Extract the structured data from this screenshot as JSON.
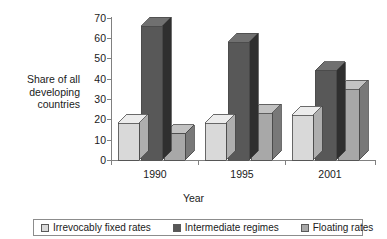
{
  "chart_data": {
    "type": "bar",
    "title": "",
    "subtitle": "",
    "xlabel": "Year",
    "ylabel": "Share of all\ndeveloping\ncountries",
    "categories": [
      "1990",
      "1995",
      "2001"
    ],
    "series": [
      {
        "name": "Irrevocably fixed rates",
        "values": [
          18,
          18,
          22
        ],
        "color": "#d9d9d9"
      },
      {
        "name": "Intermediate regimes",
        "values": [
          66,
          58,
          44
        ],
        "color": "#585858"
      },
      {
        "name": "Floating rates",
        "values": [
          13,
          23,
          35
        ],
        "color": "#a8a8a8"
      }
    ],
    "ylim": [
      0,
      70
    ],
    "ytick_values": [
      70,
      60,
      50,
      40,
      30,
      20,
      10,
      0
    ],
    "ytick_labels": [
      "70",
      "60",
      "50",
      "40",
      "30",
      "20",
      "10",
      "0"
    ],
    "grid": false,
    "legend_position": "bottom",
    "style": "3d-column"
  },
  "axes": {
    "y_title": "Share of all\ndeveloping\ncountries",
    "x_title": "Year",
    "y_ticks": [
      "70",
      "60",
      "50",
      "40",
      "30",
      "20",
      "10",
      "0"
    ],
    "x_ticks": [
      "1990",
      "1995",
      "2001"
    ]
  },
  "legend": {
    "items": [
      {
        "label": "Irrevocably fixed rates",
        "color": "#d9d9d9"
      },
      {
        "label": "Intermediate regimes",
        "color": "#585858"
      },
      {
        "label": "Floating rates",
        "color": "#a8a8a8"
      }
    ]
  },
  "colors": {
    "series_1_front": "#d9d9d9",
    "series_1_top": "#ececec",
    "series_1_side": "#aeaeae",
    "series_2_front": "#585858",
    "series_2_top": "#707070",
    "series_2_side": "#2f2f2f",
    "series_3_front": "#a8a8a8",
    "series_3_top": "#c2c2c2",
    "series_3_side": "#787878",
    "axis": "#808080",
    "text": "#1a1a1a",
    "background": "#ffffff"
  }
}
